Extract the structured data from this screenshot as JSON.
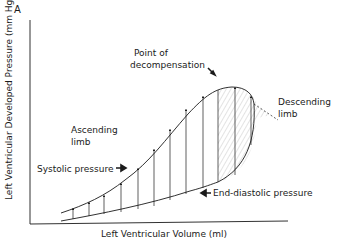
{
  "figure": {
    "panel_label": "A",
    "y_axis_label": "Left Ventricular Developed Pressure (mm Hg)",
    "x_axis_label": "Left Ventricular Volume (ml)"
  },
  "annotations": {
    "point_of_decompensation_line1": "Point of",
    "point_of_decompensation_line2": "decompensation",
    "ascending_limb_line1": "Ascending",
    "ascending_limb_line2": "limb",
    "descending_limb_line1": "Descending",
    "descending_limb_line2": "limb",
    "systolic_pressure": "Systolic pressure",
    "end_diastolic_pressure": "End-diastolic pressure"
  },
  "colors": {
    "ink": "#1a1a1a",
    "hatch": "#9a9a9a",
    "background": "#ffffff"
  }
}
